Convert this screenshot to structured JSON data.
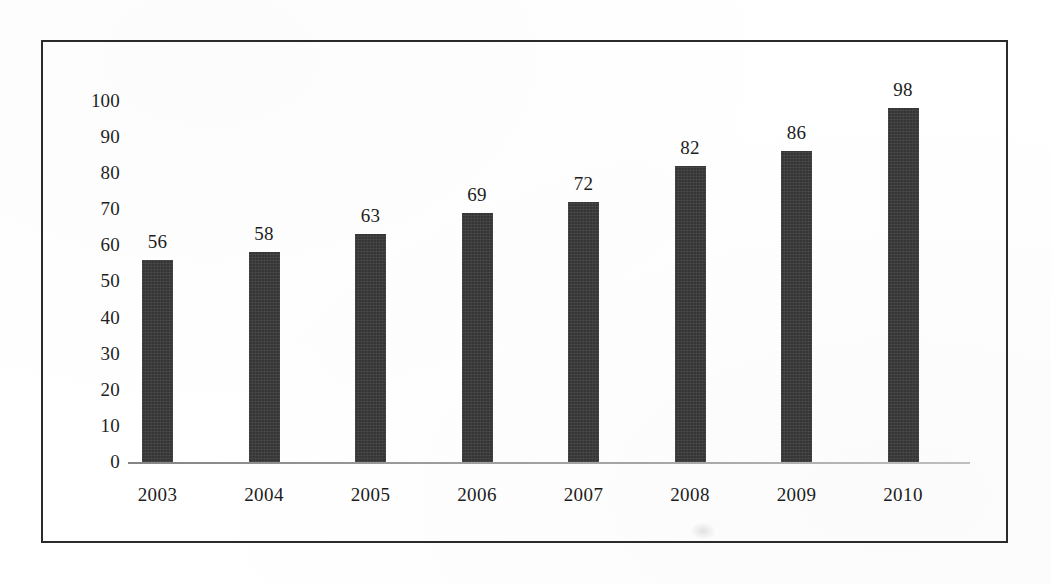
{
  "chart_data": {
    "type": "bar",
    "title": "",
    "subtitle": "",
    "xlabel": "",
    "ylabel": "",
    "categories": [
      "2003",
      "2004",
      "2005",
      "2006",
      "2007",
      "2008",
      "2009",
      "2010"
    ],
    "values": [
      56,
      58,
      63,
      69,
      72,
      82,
      86,
      98
    ],
    "value_labels": [
      "56",
      "58",
      "63",
      "69",
      "72",
      "82",
      "86",
      "98"
    ],
    "ylim": [
      0,
      100
    ],
    "y_tick_step": 10,
    "y_tick_labels": [
      "100",
      "90",
      "80",
      "70",
      "60",
      "50",
      "40",
      "30",
      "20",
      "10",
      "0"
    ],
    "y_ticks": [
      100,
      90,
      80,
      70,
      60,
      50,
      40,
      30,
      20,
      10,
      0
    ],
    "grid": false,
    "legend": false,
    "legend_position": "none",
    "data_labels_shown": true,
    "bar_color": "#3a3a3a",
    "axis_color": "#8a8a8a",
    "frame_color": "#2b2b2b",
    "background_color": "#ffffff",
    "text_color": "#1c1c1c"
  }
}
